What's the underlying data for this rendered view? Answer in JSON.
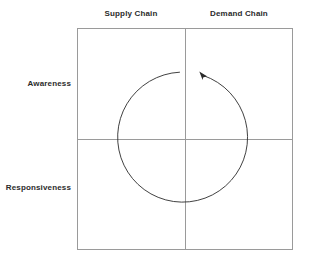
{
  "figure": {
    "type": "two-by-two-matrix",
    "background_color": "#ffffff",
    "grid_line_color": "#9a9a9a",
    "arc_color": "#2b2b2b",
    "text_color": "#2b2b2b",
    "columns": [
      {
        "id": "supply-chain",
        "label": "Supply Chain"
      },
      {
        "id": "demand-chain",
        "label": "Demand Chain"
      }
    ],
    "rows": [
      {
        "id": "awareness",
        "label": "Awareness"
      },
      {
        "id": "responsiveness",
        "label": "Responsiveness"
      }
    ],
    "cycle_arrow": {
      "name": "counterclockwise-cycle-arrow",
      "direction": "counterclockwise",
      "center_x": 185,
      "center_y": 139,
      "radius": 65,
      "gap_at": "top",
      "arrowhead_x": 201,
      "arrowhead_y": 72
    },
    "plot_area": {
      "left": 77,
      "top": 28,
      "right": 293,
      "bottom": 250,
      "center_x": 185,
      "center_y": 139
    }
  }
}
